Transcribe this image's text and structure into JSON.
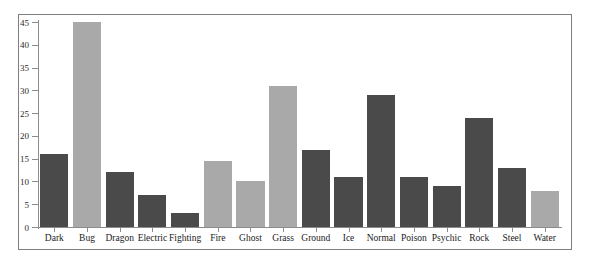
{
  "chart_data": {
    "type": "bar",
    "title": "",
    "subtitle": "",
    "xlabel": "",
    "ylabel": "",
    "categories": [
      "Dark",
      "Bug",
      "Dragon",
      "Electric",
      "Fighting",
      "Fire",
      "Ghost",
      "Grass",
      "Ground",
      "Ice",
      "Normal",
      "Poison",
      "Psychic",
      "Rock",
      "Steel",
      "Water"
    ],
    "values": [
      16,
      45,
      12,
      7,
      3,
      14.5,
      10,
      31,
      17,
      11,
      29,
      11,
      9,
      24,
      13,
      8
    ],
    "bar_colors": [
      "#4a4a4a",
      "#a9a9a9",
      "#4a4a4a",
      "#4a4a4a",
      "#4a4a4a",
      "#a9a9a9",
      "#a9a9a9",
      "#a9a9a9",
      "#4a4a4a",
      "#4a4a4a",
      "#4a4a4a",
      "#4a4a4a",
      "#4a4a4a",
      "#4a4a4a",
      "#4a4a4a",
      "#a9a9a9"
    ],
    "ylim": [
      0,
      45
    ],
    "yticks": [
      0,
      5,
      10,
      15,
      20,
      25,
      30,
      35,
      40,
      45
    ],
    "ytick_labels": [
      "0",
      "5",
      "10",
      "15",
      "20",
      "25",
      "30",
      "35",
      "40",
      "45"
    ],
    "grid": false,
    "legend": null,
    "legend_position": "none",
    "axis_color": "#8c8c8c",
    "frame_color": "#7e7e7e",
    "background_color": "#ffffff"
  }
}
